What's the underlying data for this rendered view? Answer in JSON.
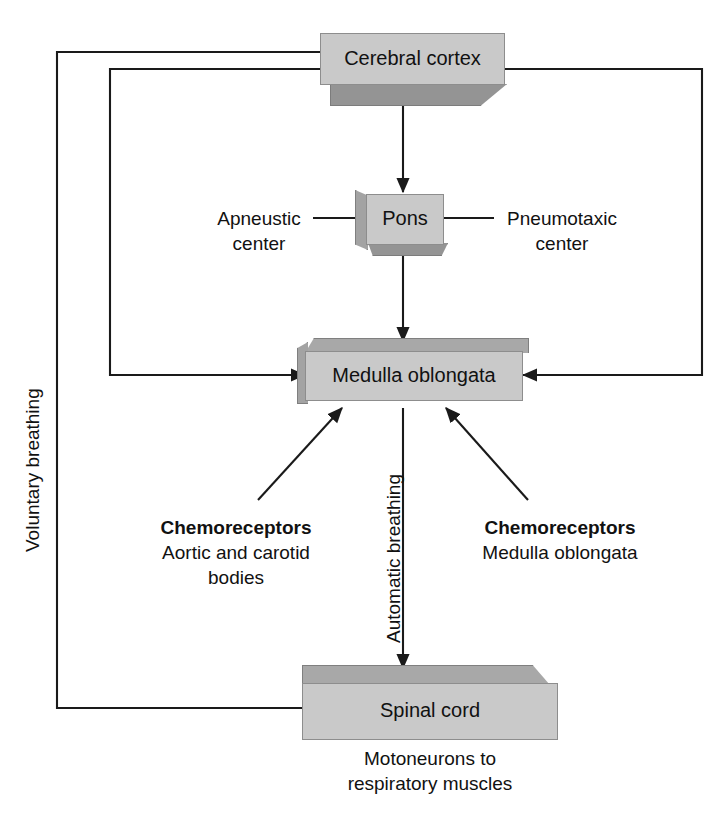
{
  "figure": {
    "cropped_header_text": "Respiratory control centers",
    "bg_color": "#ffffff",
    "box_face_color": "#c9c9c9",
    "box_shadow_color": "#949494",
    "line_color": "#1a1a1a"
  },
  "nodes": {
    "cerebral_cortex": {
      "label": "Cerebral cortex"
    },
    "pons": {
      "label": "Pons"
    },
    "medulla": {
      "label": "Medulla oblongata"
    },
    "spinal_cord": {
      "label": "Spinal cord"
    }
  },
  "labels": {
    "apneustic_center": "Apneustic\ncenter",
    "pneumotaxic_center": "Pneumotaxic\ncenter",
    "chemoreceptors_peripheral_title": "Chemoreceptors",
    "chemoreceptors_peripheral_detail": "Aortic and carotid\nbodies",
    "chemoreceptors_central_title": "Chemoreceptors",
    "chemoreceptors_central_detail": "Medulla oblongata",
    "motoneurons": "Motoneurons to\nrespiratory muscles",
    "voluntary_breathing": "Voluntary breathing",
    "automatic_breathing": "Automatic breathing"
  },
  "connections": [
    {
      "from": "cerebral_cortex",
      "to": "spinal_cord",
      "pathway": "Voluntary breathing",
      "arrow": "to-spinal-cord"
    },
    {
      "from": "cerebral_cortex",
      "to": "medulla",
      "pathway": "descending left",
      "arrow": "to-medulla-left"
    },
    {
      "from": "cerebral_cortex",
      "to": "medulla",
      "pathway": "descending right",
      "arrow": "to-medulla-right"
    },
    {
      "from": "cerebral_cortex",
      "to": "pons",
      "pathway": "direct",
      "arrow": "to-pons"
    },
    {
      "from": "pons",
      "to": "medulla",
      "pathway": "direct",
      "arrow": "to-medulla-top"
    },
    {
      "from": "medulla",
      "to": "spinal_cord",
      "pathway": "Automatic breathing",
      "arrow": "to-spinal-cord-top"
    },
    {
      "from": "chemoreceptors_peripheral",
      "to": "medulla",
      "pathway": "afferent",
      "arrow": "diagonal-left"
    },
    {
      "from": "chemoreceptors_central",
      "to": "medulla",
      "pathway": "afferent",
      "arrow": "diagonal-right"
    },
    {
      "from": "apneustic_center",
      "to": "pons",
      "pathway": "tie-line",
      "arrow": "none"
    },
    {
      "from": "pneumotaxic_center",
      "to": "pons",
      "pathway": "tie-line",
      "arrow": "none"
    }
  ]
}
